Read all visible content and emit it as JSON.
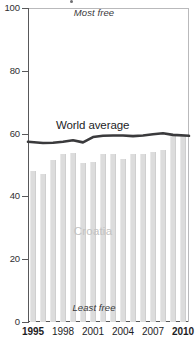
{
  "chart_data": {
    "type": "bar",
    "title": "",
    "xlabel": "",
    "ylabel": "",
    "ylim": [
      0,
      100
    ],
    "xlim": [
      1995,
      2010
    ],
    "grid": false,
    "legend_position": "inline-annotations",
    "categories": [
      1995,
      1996,
      1997,
      1998,
      1999,
      2000,
      2001,
      2002,
      2003,
      2004,
      2005,
      2006,
      2007,
      2008,
      2009,
      2010
    ],
    "ytick_labels": [
      "0",
      "20",
      "40",
      "60",
      "80",
      "100"
    ],
    "ytick_values": [
      0,
      20,
      40,
      60,
      80,
      100
    ],
    "xtick_labels": [
      "1995",
      "1998",
      "2001",
      "2004",
      "2007",
      "2010"
    ],
    "xtick_values": [
      1995,
      1998,
      2001,
      2004,
      2007,
      2010
    ],
    "xtick_bold": [
      true,
      false,
      false,
      false,
      false,
      true
    ],
    "series": [
      {
        "name": "Croatia",
        "render": "bar",
        "color": "#dcdcdc",
        "values": [
          48.0,
          47.0,
          51.7,
          53.4,
          53.7,
          50.6,
          51.0,
          53.4,
          53.4,
          52.0,
          53.6,
          53.6,
          54.0,
          54.9,
          59.2,
          59.2
        ]
      },
      {
        "name": "World average",
        "render": "line",
        "color": "#3a3a3c",
        "values": [
          57.4,
          57.0,
          57.1,
          57.4,
          57.9,
          57.2,
          58.9,
          59.3,
          59.4,
          59.4,
          59.2,
          59.4,
          59.8,
          60.1,
          59.6,
          59.3
        ]
      }
    ],
    "annotations": [
      {
        "name": "most-free",
        "text": "Most free",
        "position": "top-center",
        "style": "italic"
      },
      {
        "name": "least-free",
        "text": "Least free",
        "position": "bottom-center",
        "style": "italic"
      },
      {
        "name": "croatia",
        "text": "Croatia",
        "position": "inside-bars",
        "color": "#c2c2c2"
      },
      {
        "name": "world-average",
        "text": "World average",
        "position": "above-line",
        "color": "#1d1d1f"
      }
    ]
  },
  "axis": {
    "y_labels": [
      "100",
      "80",
      "60",
      "40",
      "20",
      "0"
    ],
    "x_labels": [
      "1995",
      "1998",
      "2001",
      "2004",
      "2007",
      "2010"
    ]
  },
  "labels": {
    "most_free": "Most free",
    "least_free": "Least free",
    "croatia": "Croatia",
    "world_average": "World average"
  },
  "colors": {
    "bar": "#dcdcdc",
    "line": "#3a3a3c",
    "axis": "#58585a",
    "croatia_label": "#c2c2c2",
    "text": "#1c1c1e"
  }
}
